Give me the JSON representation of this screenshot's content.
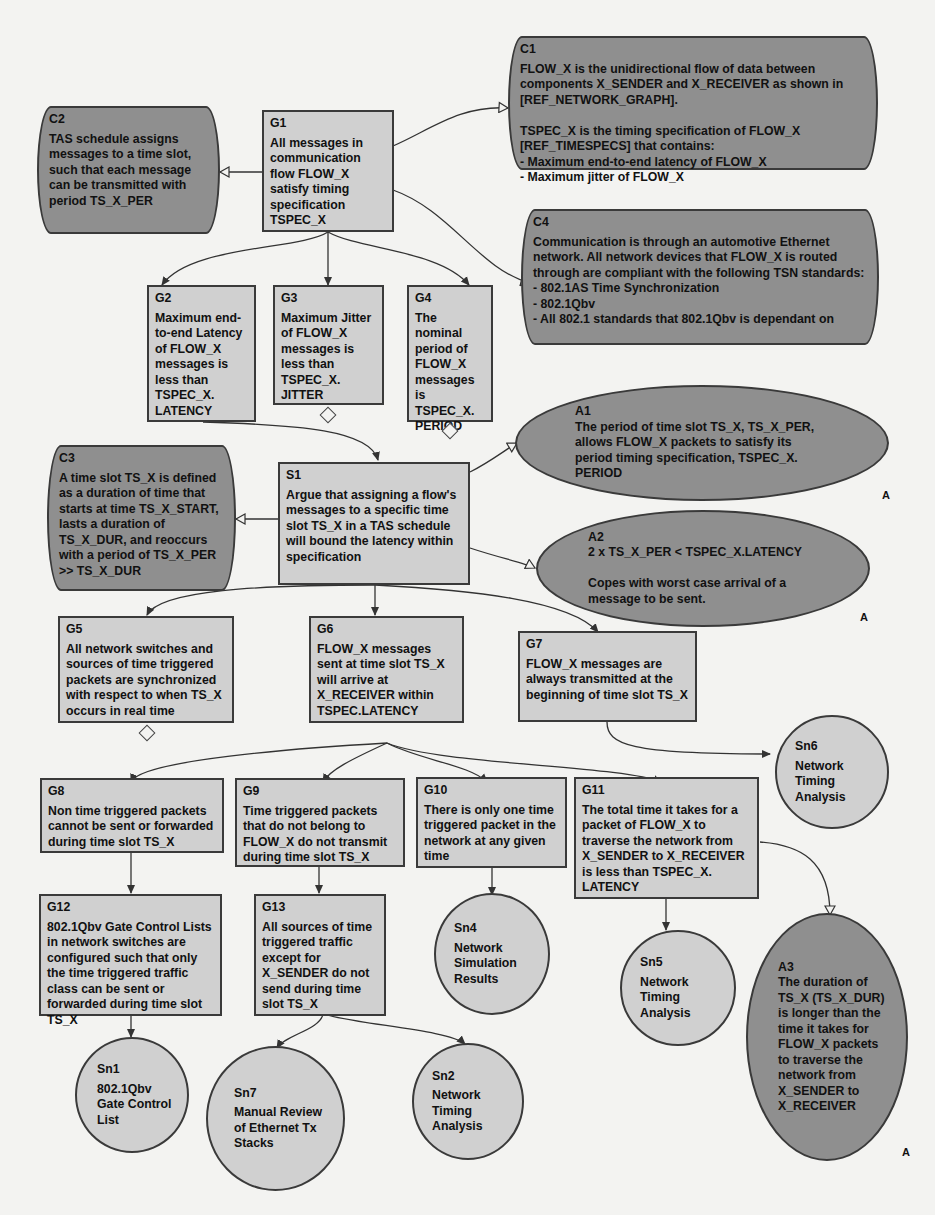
{
  "diagram": {
    "type": "GSN assurance case",
    "nodes": {
      "G1": {
        "id": "G1",
        "kind": "goal",
        "text": "All messages in communication flow FLOW_X satisfy timing specification TSPEC_X"
      },
      "C1": {
        "id": "C1",
        "kind": "context",
        "text": "FLOW_X is the unidirectional flow of data between components X_SENDER and X_RECEIVER as shown in [REF_NETWORK_GRAPH].\n\nTSPEC_X is the timing specification of FLOW_X [REF_TIMESPECS] that contains:\n- Maximum end-to-end latency of FLOW_X\n- Maximum jitter of FLOW_X"
      },
      "C2": {
        "id": "C2",
        "kind": "context",
        "text": "TAS schedule assigns messages to a time slot, such that each message can be transmitted with period TS_X_PER"
      },
      "C4": {
        "id": "C4",
        "kind": "context",
        "text": "Communication is through an automotive Ethernet network. All network devices that FLOW_X is routed through are compliant with the following TSN standards:\n- 802.1AS Time Synchronization\n- 802.1Qbv\n- All 802.1 standards that 802.1Qbv is dependant on"
      },
      "G2": {
        "id": "G2",
        "kind": "goal",
        "text": "Maximum end-to-end Latency of FLOW_X messages is less than TSPEC_X. LATENCY"
      },
      "G3": {
        "id": "G3",
        "kind": "goal",
        "text": "Maximum Jitter of FLOW_X messages is less than TSPEC_X. JITTER",
        "undeveloped": true
      },
      "G4": {
        "id": "G4",
        "kind": "goal",
        "text": "The nominal period of FLOW_X messages is TSPEC_X. PERIOD",
        "undeveloped": true
      },
      "C3": {
        "id": "C3",
        "kind": "context",
        "text": "A time slot TS_X is defined as a duration of time that starts at time TS_X_START, lasts a duration of TS_X_DUR, and reoccurs with a period of TS_X_PER >> TS_X_DUR"
      },
      "S1": {
        "id": "S1",
        "kind": "strategy",
        "text": "Argue that assigning a flow's messages to a specific time slot TS_X in a TAS schedule will bound the latency within specification"
      },
      "A1": {
        "id": "A1",
        "kind": "assumption",
        "text": "The period of time slot TS_X, TS_X_PER, allows FLOW_X packets to satisfy its period timing specification, TSPEC_X. PERIOD",
        "marker": "A"
      },
      "A2": {
        "id": "A2",
        "kind": "assumption",
        "text": "2 x TS_X_PER < TSPEC_X.LATENCY\n\nCopes with worst case arrival of a message to be sent.",
        "marker": "A"
      },
      "G5": {
        "id": "G5",
        "kind": "goal",
        "text": "All network switches and sources of time triggered packets are synchronized with respect to when TS_X occurs in real time",
        "undeveloped": true
      },
      "G6": {
        "id": "G6",
        "kind": "goal",
        "text": "FLOW_X messages sent at time slot TS_X will arrive at X_RECEIVER within TSPEC.LATENCY"
      },
      "G7": {
        "id": "G7",
        "kind": "goal",
        "text": "FLOW_X messages are always transmitted at the beginning of time slot TS_X"
      },
      "Sn6": {
        "id": "Sn6",
        "kind": "solution",
        "text": "Network Timing Analysis"
      },
      "G8": {
        "id": "G8",
        "kind": "goal",
        "text": "Non time triggered packets cannot be sent or forwarded during time slot TS_X"
      },
      "G9": {
        "id": "G9",
        "kind": "goal",
        "text": "Time triggered packets that do not belong to FLOW_X do not transmit during time slot TS_X"
      },
      "G10": {
        "id": "G10",
        "kind": "goal",
        "text": "There is only one time triggered packet in the network at any given time"
      },
      "G11": {
        "id": "G11",
        "kind": "goal",
        "text": "The total time it takes for a packet of FLOW_X to traverse the network from X_SENDER to X_RECEIVER is less than TSPEC_X. LATENCY"
      },
      "G12": {
        "id": "G12",
        "kind": "goal",
        "text": "802.1Qbv Gate Control Lists in network switches are configured such that only the time triggered traffic class can be sent or forwarded during time slot TS_X"
      },
      "G13": {
        "id": "G13",
        "kind": "goal",
        "text": "All sources of time triggered traffic except for X_SENDER do not send during time slot TS_X"
      },
      "Sn4": {
        "id": "Sn4",
        "kind": "solution",
        "text": "Network Simulation Results"
      },
      "Sn5": {
        "id": "Sn5",
        "kind": "solution",
        "text": "Network Timing Analysis"
      },
      "A3": {
        "id": "A3",
        "kind": "assumption",
        "text": "The duration of TS_X (TS_X_DUR) is longer than the time it takes for FLOW_X packets to traverse the network from X_SENDER to X_RECEIVER",
        "marker": "A"
      },
      "Sn1": {
        "id": "Sn1",
        "kind": "solution",
        "text": "802.1Qbv Gate Control List"
      },
      "Sn7": {
        "id": "Sn7",
        "kind": "solution",
        "text": "Manual Review of Ethernet Tx Stacks"
      },
      "Sn2": {
        "id": "Sn2",
        "kind": "solution",
        "text": "Network Timing Analysis"
      }
    },
    "edges": [
      {
        "from": "G1",
        "to": "C1",
        "type": "in-context-of"
      },
      {
        "from": "G1",
        "to": "C2",
        "type": "in-context-of"
      },
      {
        "from": "G1",
        "to": "C4",
        "type": "in-context-of"
      },
      {
        "from": "G1",
        "to": "G2",
        "type": "supported-by"
      },
      {
        "from": "G1",
        "to": "G3",
        "type": "supported-by"
      },
      {
        "from": "G1",
        "to": "G4",
        "type": "supported-by"
      },
      {
        "from": "G2",
        "to": "S1",
        "type": "supported-by"
      },
      {
        "from": "S1",
        "to": "C3",
        "type": "in-context-of"
      },
      {
        "from": "S1",
        "to": "A1",
        "type": "in-context-of"
      },
      {
        "from": "S1",
        "to": "A2",
        "type": "in-context-of"
      },
      {
        "from": "S1",
        "to": "G5",
        "type": "supported-by"
      },
      {
        "from": "S1",
        "to": "G6",
        "type": "supported-by"
      },
      {
        "from": "S1",
        "to": "G7",
        "type": "supported-by"
      },
      {
        "from": "G7",
        "to": "Sn6",
        "type": "supported-by"
      },
      {
        "from": "G6",
        "to": "G8",
        "type": "supported-by"
      },
      {
        "from": "G6",
        "to": "G9",
        "type": "supported-by"
      },
      {
        "from": "G6",
        "to": "G10",
        "type": "supported-by"
      },
      {
        "from": "G6",
        "to": "G11",
        "type": "supported-by"
      },
      {
        "from": "G8",
        "to": "G12",
        "type": "supported-by"
      },
      {
        "from": "G9",
        "to": "G13",
        "type": "supported-by"
      },
      {
        "from": "G10",
        "to": "Sn4",
        "type": "supported-by"
      },
      {
        "from": "G11",
        "to": "Sn5",
        "type": "supported-by"
      },
      {
        "from": "G11",
        "to": "A3",
        "type": "in-context-of"
      },
      {
        "from": "G12",
        "to": "Sn1",
        "type": "supported-by"
      },
      {
        "from": "G13",
        "to": "Sn7",
        "type": "supported-by"
      },
      {
        "from": "G13",
        "to": "Sn2",
        "type": "supported-by"
      }
    ]
  },
  "colors": {
    "background": "#f3f3f1",
    "goal_fill": "#d0d0d0",
    "context_fill": "#8f8f8f",
    "assumption_fill": "#8f8f8f",
    "solution_fill": "#d0d0d0",
    "border": "#3a3a3a",
    "text": "#111111"
  }
}
